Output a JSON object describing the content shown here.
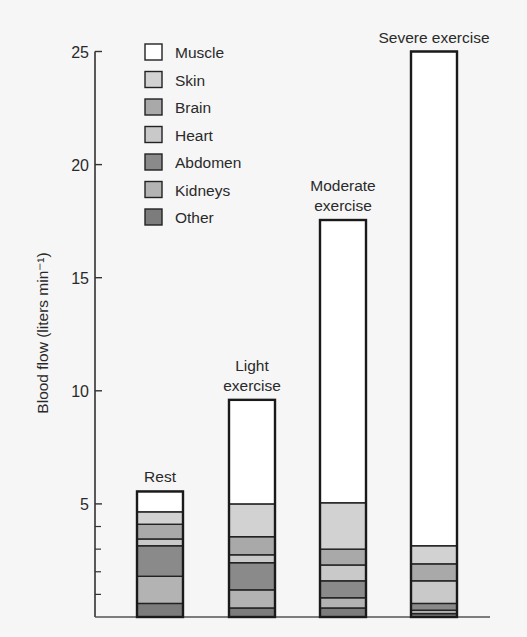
{
  "chart_data": {
    "type": "bar",
    "stacked": true,
    "title": "",
    "xlabel": "",
    "ylabel": "Blood flow (liters min⁻¹)",
    "ylim": [
      0,
      25
    ],
    "yticks": [
      5,
      10,
      15,
      20,
      25
    ],
    "minor_yticks": [
      1,
      2,
      3,
      4
    ],
    "grid": false,
    "legend_position": "upper-left",
    "categories": [
      "Rest",
      "Light exercise",
      "Moderate exercise",
      "Severe exercise"
    ],
    "category_label_lines": [
      [
        "Rest"
      ],
      [
        "Light",
        "exercise"
      ],
      [
        "Moderate",
        "exercise"
      ],
      [
        "Severe exercise"
      ]
    ],
    "series": [
      {
        "name": "Other",
        "color": "#7c7c7c",
        "values": [
          0.6,
          0.4,
          0.4,
          0.15
        ]
      },
      {
        "name": "Kidneys",
        "color": "#b3b3b3",
        "values": [
          1.2,
          0.8,
          0.45,
          0.15
        ]
      },
      {
        "name": "Abdomen",
        "color": "#8a8a8a",
        "values": [
          1.35,
          1.2,
          0.75,
          0.3
        ]
      },
      {
        "name": "Heart",
        "color": "#c9c9c9",
        "values": [
          0.3,
          0.35,
          0.7,
          1.0
        ]
      },
      {
        "name": "Brain",
        "color": "#a9a9a9",
        "values": [
          0.65,
          0.8,
          0.7,
          0.75
        ]
      },
      {
        "name": "Skin",
        "color": "#d2d2d2",
        "values": [
          0.55,
          1.45,
          2.05,
          0.8
        ]
      },
      {
        "name": "Muscle",
        "color": "#ffffff",
        "values": [
          0.9,
          4.6,
          12.5,
          21.85
        ]
      }
    ],
    "totals": [
      5.55,
      9.6,
      17.55,
      25.0
    ],
    "legend_order": [
      "Muscle",
      "Skin",
      "Brain",
      "Heart",
      "Abdomen",
      "Kidneys",
      "Other"
    ]
  }
}
